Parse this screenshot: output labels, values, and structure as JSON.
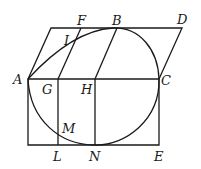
{
  "diagram": {
    "type": "geometric-figure",
    "labels": {
      "A": "A",
      "B": "B",
      "C": "C",
      "D": "D",
      "E": "E",
      "F": "F",
      "G": "G",
      "H": "H",
      "I": "I",
      "L": "L",
      "M": "M",
      "N": "N"
    },
    "points": {
      "A": [
        28,
        79
      ],
      "B": [
        117,
        28
      ],
      "C": [
        159,
        79
      ],
      "D": [
        182,
        28
      ],
      "E": [
        159,
        145
      ],
      "F": [
        81,
        28
      ],
      "G": [
        58,
        79
      ],
      "H": [
        95,
        79
      ],
      "I": [
        73,
        43
      ],
      "L": [
        58,
        145
      ],
      "M": [
        58,
        134
      ],
      "N": [
        95,
        145
      ],
      "P": [
        51,
        28
      ]
    },
    "stroke_color": "#1a1a1a",
    "background": "#ffffff"
  }
}
